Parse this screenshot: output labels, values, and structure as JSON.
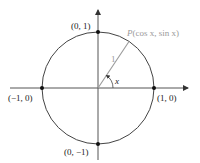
{
  "diagram": {
    "colors": {
      "axis": "#444444",
      "circle": "#444444",
      "radius": "#9a9a9a",
      "label": "#222222",
      "point_label": "#9a9a9a"
    },
    "points": [
      {
        "id": "top",
        "label": "(0, 1)"
      },
      {
        "id": "left",
        "label": "(−1, 0)"
      },
      {
        "id": "right",
        "label": "(1, 0)"
      },
      {
        "id": "bottom",
        "label": "(0, −1)"
      }
    ],
    "point_p": {
      "name": "P",
      "coords": "(cos x, sin x)"
    },
    "radius_label": "1",
    "angle_label": "x"
  }
}
